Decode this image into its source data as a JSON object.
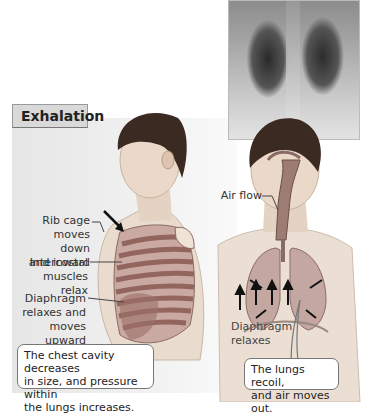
{
  "figure": {
    "title": "Exhalation",
    "xray_caption": "",
    "left_figure": {
      "labels": [
        {
          "id": "rib-cage",
          "lines": [
            "Rib cage",
            "moves down",
            "and inward"
          ]
        },
        {
          "id": "intercostal",
          "lines": [
            "Intercostal",
            "muscles relax"
          ]
        },
        {
          "id": "diaphragm",
          "lines": [
            "Diaphragm",
            "relaxes and",
            "moves upward"
          ]
        }
      ],
      "callout": [
        "The chest cavity decreases",
        "in size, and pressure within",
        "the lungs increases."
      ]
    },
    "right_figure": {
      "labels": [
        {
          "id": "air-flow",
          "lines": [
            "Air flow"
          ]
        },
        {
          "id": "diaphragm-relaxes",
          "lines": [
            "Diaphragm",
            "relaxes"
          ]
        }
      ],
      "callout": [
        "The lungs recoil,",
        "and air moves out."
      ]
    }
  },
  "colors": {
    "panel": "#ececec",
    "title_box": "#d9d9d9",
    "skin": "#e7d7c9",
    "hair": "#3a2a22",
    "ribs": "#8a5a54",
    "lungs": "#b98f89",
    "arrow": "#111111"
  }
}
